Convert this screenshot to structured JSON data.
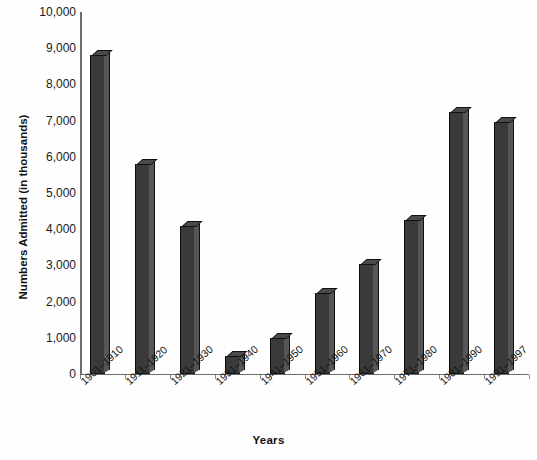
{
  "chart_data": {
    "type": "bar",
    "title": "",
    "xlabel": "Years",
    "ylabel": "Numbers Admitted (in thousands)",
    "categories": [
      "1901–1910",
      "1911–1920",
      "1921–1930",
      "1931–1940",
      "1941–1950",
      "1951–1960",
      "1961–1970",
      "1971–1980",
      "1981–1990",
      "1991–1997"
    ],
    "values": [
      8800,
      5800,
      4100,
      500,
      1000,
      2250,
      3050,
      4250,
      7250,
      6950
    ],
    "ylim": [
      0,
      10000
    ],
    "ytick_labels": [
      "10,000",
      "9,000",
      "8,000",
      "7,000",
      "6,000",
      "5,000",
      "4,000",
      "3,000",
      "2,000",
      "1,000",
      "0"
    ],
    "ytick_values": [
      10000,
      9000,
      8000,
      7000,
      6000,
      5000,
      4000,
      3000,
      2000,
      1000,
      0
    ],
    "grid": false,
    "legend": null,
    "legend_position": "none",
    "bar_style": "3d-extruded",
    "colors": {
      "bar_face": "#3a3a3a",
      "bar_side": "#565656",
      "bar_top": "#4a4a4a",
      "axis": "#6d6d6d",
      "text": "#111111",
      "background": "#ffffff"
    }
  }
}
